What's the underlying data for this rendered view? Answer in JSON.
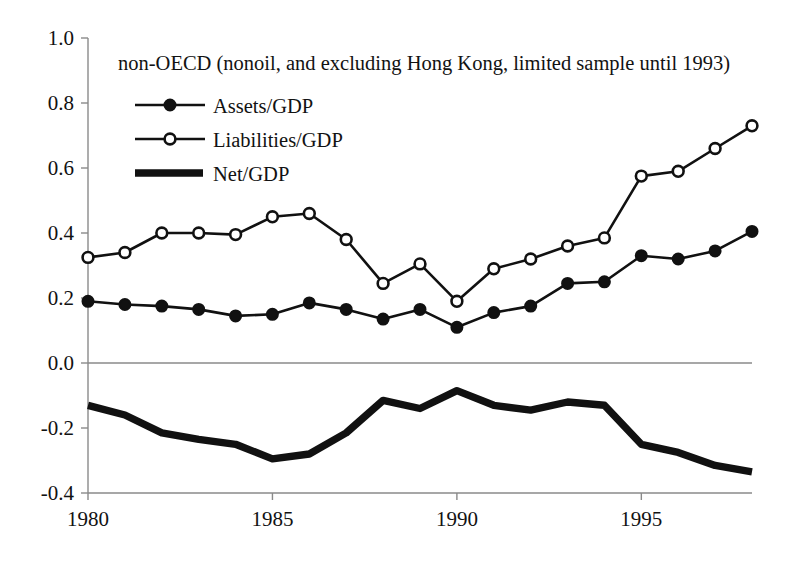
{
  "chart_data": {
    "type": "line",
    "title": "non-OECD (nonoil, and excluding Hong Kong, limited sample until 1993)",
    "xlabel": "",
    "ylabel": "",
    "xlim": [
      1980,
      1998
    ],
    "ylim": [
      -0.4,
      1.0
    ],
    "grid": false,
    "legend_position": "top-left",
    "x": [
      1980,
      1981,
      1982,
      1983,
      1984,
      1985,
      1986,
      1987,
      1988,
      1989,
      1990,
      1991,
      1992,
      1993,
      1994,
      1995,
      1996,
      1997,
      1998
    ],
    "x_tick_labels": [
      "1980",
      "1985",
      "1990",
      "1995"
    ],
    "x_ticks": [
      1980,
      1985,
      1990,
      1995
    ],
    "y_tick_labels": [
      "1.0",
      "0.8",
      "0.6",
      "0.4",
      "0.2",
      "0.0",
      "-0.2",
      "-0.4"
    ],
    "y_ticks": [
      1.0,
      0.8,
      0.6,
      0.4,
      0.2,
      0.0,
      -0.2,
      -0.4
    ],
    "series": [
      {
        "name": "Assets/GDP",
        "marker": "filled-circle",
        "values": [
          0.19,
          0.18,
          0.175,
          0.165,
          0.145,
          0.15,
          0.185,
          0.165,
          0.135,
          0.165,
          0.11,
          0.155,
          0.175,
          0.245,
          0.25,
          0.33,
          0.32,
          0.345,
          0.405
        ]
      },
      {
        "name": "Liabilities/GDP",
        "marker": "open-circle",
        "values": [
          0.325,
          0.34,
          0.4,
          0.4,
          0.395,
          0.45,
          0.46,
          0.38,
          0.245,
          0.305,
          0.19,
          0.29,
          0.32,
          0.36,
          0.385,
          0.575,
          0.59,
          0.66,
          0.73
        ]
      },
      {
        "name": "Net/GDP",
        "marker": "none",
        "values": [
          -0.13,
          -0.16,
          -0.215,
          -0.235,
          -0.25,
          -0.295,
          -0.28,
          -0.215,
          -0.115,
          -0.14,
          -0.085,
          -0.13,
          -0.145,
          -0.12,
          -0.13,
          -0.25,
          -0.275,
          -0.315,
          -0.335
        ]
      }
    ]
  },
  "legend": {
    "items": [
      {
        "label": "Assets/GDP",
        "marker": "filled-circle"
      },
      {
        "label": "Liabilities/GDP",
        "marker": "open-circle"
      },
      {
        "label": "Net/GDP",
        "marker": "thick-line"
      }
    ]
  }
}
